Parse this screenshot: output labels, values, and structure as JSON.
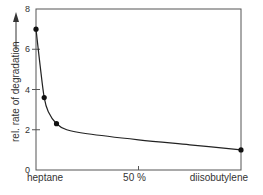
{
  "chart_data": {
    "type": "line",
    "title": "",
    "xlabel": "",
    "ylabel": "rel. rate of degradation",
    "x_left_label": "heptane",
    "x_mid_label": "50 %",
    "x_right_label": "diisobutylene",
    "x_unit": "% diisobutylene in heptane",
    "xlim": [
      0,
      100
    ],
    "ylim": [
      0,
      8
    ],
    "yticks": [
      0,
      2,
      4,
      6,
      8
    ],
    "xticks": [
      50
    ],
    "grid": false,
    "legend": "none",
    "series": [
      {
        "name": "rel. rate of degradation",
        "points": [
          {
            "x": 0,
            "y": 7.0
          },
          {
            "x": 4,
            "y": 3.6
          },
          {
            "x": 10,
            "y": 2.3
          },
          {
            "x": 100,
            "y": 1.0
          }
        ],
        "curve": [
          {
            "x": 0,
            "y": 7.0
          },
          {
            "x": 2,
            "y": 5.2
          },
          {
            "x": 4,
            "y": 3.6
          },
          {
            "x": 6,
            "y": 2.9
          },
          {
            "x": 10,
            "y": 2.3
          },
          {
            "x": 15,
            "y": 2.0
          },
          {
            "x": 25,
            "y": 1.8
          },
          {
            "x": 50,
            "y": 1.5
          },
          {
            "x": 75,
            "y": 1.25
          },
          {
            "x": 100,
            "y": 1.0
          }
        ]
      }
    ],
    "colors": {
      "line": "#222222",
      "marker": "#111111",
      "axis": "#555555"
    }
  }
}
